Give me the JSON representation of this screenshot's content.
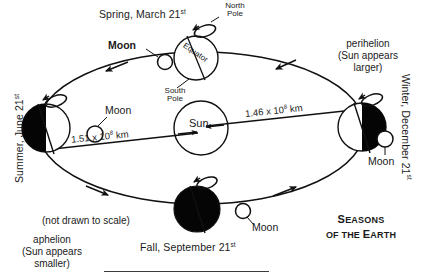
{
  "diagram": {
    "title_line1": "Seasons",
    "title_line2": "of the Earth",
    "note_not_to_scale": "(not drawn to scale)",
    "sun_label": "Sun",
    "earth_positions": [
      {
        "id": "spring",
        "label": "Spring, March 21",
        "ordinal": "st",
        "equator_label": "Equator",
        "north_pole_label_line1": "North",
        "north_pole_label_line2": "Pole",
        "south_pole_label_line1": "South",
        "south_pole_label_line2": "Pole",
        "shading": "white"
      },
      {
        "id": "summer",
        "label": "Summer, June 21",
        "ordinal": "st",
        "shading": "left-black-right-white"
      },
      {
        "id": "fall",
        "label": "Fall, September 21",
        "ordinal": "st",
        "shading": "black"
      },
      {
        "id": "winter",
        "label": "Winter, December 21",
        "ordinal": "st",
        "shading": "left-white-right-black"
      }
    ],
    "moon_labels": [
      {
        "id": "moon-spring",
        "text": "Moon"
      },
      {
        "id": "moon-summer",
        "text": "Moon"
      },
      {
        "id": "moon-fall",
        "text": "Moon"
      },
      {
        "id": "moon-winter",
        "text": "Moon"
      }
    ],
    "distances": [
      {
        "id": "aphelion-distance",
        "value": "1.51 x 10",
        "exponent": "8",
        "unit": " km"
      },
      {
        "id": "perihelion-distance",
        "value": "1.46 x 10",
        "exponent": "8",
        "unit": " km"
      }
    ],
    "apsides": [
      {
        "id": "perihelion",
        "line1": "perihelion",
        "line2": "(Sun appears",
        "line3": "larger)"
      },
      {
        "id": "aphelion",
        "line1": "aphelion",
        "line2": "(Sun appears",
        "line3": "smaller)"
      }
    ],
    "colors": {
      "ink": "#1a1a1a",
      "line": "#111111",
      "earth_dark": "#050505",
      "earth_light": "#ffffff",
      "background": "#ffffff",
      "baseline_rule": "#3b3b3b"
    }
  }
}
